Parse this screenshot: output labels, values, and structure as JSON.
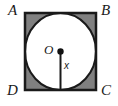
{
  "figure": {
    "background_color": "#ffffff",
    "stroke_color": "#1a1a1a",
    "shade_color": "#808080",
    "circle_fill": "#ffffff",
    "labels": {
      "vertex_top_left": "A",
      "vertex_top_right": "B",
      "vertex_bottom_right": "C",
      "vertex_bottom_left": "D",
      "center": "O",
      "radius": "x"
    },
    "geometry": {
      "square": {
        "left": 24,
        "top": 12,
        "width": 73,
        "height": 79,
        "stroke_width": 2
      },
      "circle": {
        "center_x": 60,
        "center_y": 51,
        "radius_x": 35,
        "radius_y": 38,
        "stroke_width": 2
      },
      "center_dot": {
        "x": 60,
        "y": 51,
        "r": 3
      },
      "radius_segment": {
        "x1": 60,
        "y1": 51,
        "x2": 60,
        "y2": 91,
        "stroke_width": 2
      }
    }
  }
}
